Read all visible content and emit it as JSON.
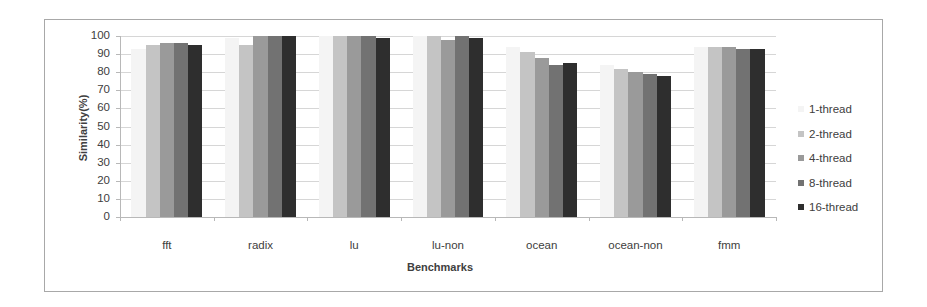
{
  "chart_data": {
    "type": "bar",
    "title": "",
    "xlabel": "Benchmarks",
    "ylabel": "Similarity(%)",
    "ylim": [
      0,
      100
    ],
    "yticks": [
      0,
      10,
      20,
      30,
      40,
      50,
      60,
      70,
      80,
      90,
      100
    ],
    "grid": true,
    "legend_position": "right",
    "categories": [
      "fft",
      "radix",
      "lu",
      "lu-non",
      "ocean",
      "ocean-non",
      "fmm"
    ],
    "series": [
      {
        "name": "1-thread",
        "color": "#f4f4f4",
        "values": [
          93,
          99,
          100,
          100,
          94,
          84,
          94
        ]
      },
      {
        "name": "2-thread",
        "color": "#c4c4c4",
        "values": [
          95,
          95,
          100,
          100,
          91,
          82,
          94
        ]
      },
      {
        "name": "4-thread",
        "color": "#9a9a9a",
        "values": [
          96,
          100,
          100,
          98,
          88,
          80,
          94
        ]
      },
      {
        "name": "8-thread",
        "color": "#727272",
        "values": [
          96,
          100,
          100,
          100,
          84,
          79,
          93
        ]
      },
      {
        "name": "16-thread",
        "color": "#2e2e2e",
        "values": [
          95,
          100,
          99,
          99,
          85,
          78,
          93
        ]
      }
    ]
  },
  "labels": {
    "ytitle": "Similarity(%)",
    "xtitle": "Benchmarks",
    "yticks": [
      "100",
      "90",
      "80",
      "70",
      "60",
      "50",
      "40",
      "30",
      "20",
      "10",
      "0"
    ],
    "categories": [
      "fft",
      "radix",
      "lu",
      "lu-non",
      "ocean",
      "ocean-non",
      "fmm"
    ],
    "legend": [
      "1-thread",
      "2-thread",
      "4-thread",
      "8-thread",
      "16-thread"
    ]
  }
}
